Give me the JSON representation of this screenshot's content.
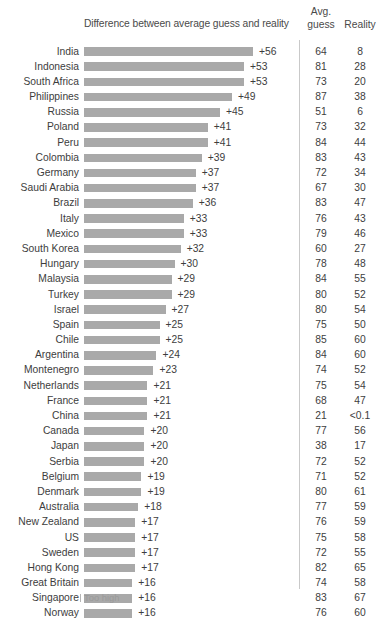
{
  "header": {
    "bar_column_title": "Difference between average guess and reality",
    "avg_line1": "Avg.",
    "avg_line2": "guess",
    "reality": "Reality"
  },
  "legend": {
    "tick_icon": "tick-mark-icon",
    "label": "Too high"
  },
  "chart_data": {
    "type": "bar",
    "title": "Difference between average guess and reality",
    "xlabel": "",
    "ylabel": "",
    "orientation": "horizontal",
    "grid": false,
    "legend_position": "bottom-left",
    "legend_entries": [
      "Too high"
    ],
    "xlim": [
      0,
      60
    ],
    "bar_color": "#a9a9a9",
    "columns": [
      "Country",
      "Difference between average guess and reality",
      "Avg. guess",
      "Reality"
    ],
    "categories": [
      "India",
      "Indonesia",
      "South Africa",
      "Philippines",
      "Russia",
      "Poland",
      "Peru",
      "Colombia",
      "Germany",
      "Saudi Arabia",
      "Brazil",
      "Italy",
      "Mexico",
      "South Korea",
      "Hungary",
      "Malaysia",
      "Turkey",
      "Israel",
      "Spain",
      "Chile",
      "Argentina",
      "Montenegro",
      "Netherlands",
      "France",
      "China",
      "Canada",
      "Japan",
      "Serbia",
      "Belgium",
      "Denmark",
      "Australia",
      "New Zealand",
      "US",
      "Sweden",
      "Hong Kong",
      "Great Britain",
      "Singapore",
      "Norway"
    ],
    "values": [
      56,
      53,
      53,
      49,
      45,
      41,
      41,
      39,
      37,
      37,
      36,
      33,
      33,
      32,
      30,
      29,
      29,
      27,
      25,
      25,
      24,
      23,
      21,
      21,
      21,
      20,
      20,
      20,
      19,
      19,
      18,
      17,
      17,
      17,
      17,
      16,
      16,
      16
    ],
    "value_labels": [
      "+56",
      "+53",
      "+53",
      "+49",
      "+45",
      "+41",
      "+41",
      "+39",
      "+37",
      "+37",
      "+36",
      "+33",
      "+33",
      "+32",
      "+30",
      "+29",
      "+29",
      "+27",
      "+25",
      "+25",
      "+24",
      "+23",
      "+21",
      "+21",
      "+21",
      "+20",
      "+20",
      "+20",
      "+19",
      "+19",
      "+18",
      "+17",
      "+17",
      "+17",
      "+17",
      "+16",
      "+16",
      "+16"
    ],
    "avg_guess": [
      "64",
      "81",
      "73",
      "87",
      "51",
      "73",
      "84",
      "83",
      "72",
      "67",
      "83",
      "76",
      "79",
      "60",
      "78",
      "84",
      "80",
      "80",
      "75",
      "85",
      "84",
      "74",
      "75",
      "68",
      "21",
      "77",
      "38",
      "72",
      "71",
      "80",
      "77",
      "76",
      "75",
      "72",
      "82",
      "74",
      "83",
      "76"
    ],
    "reality": [
      "8",
      "28",
      "20",
      "38",
      "6",
      "32",
      "44",
      "43",
      "34",
      "30",
      "47",
      "43",
      "46",
      "27",
      "48",
      "55",
      "52",
      "54",
      "50",
      "60",
      "60",
      "52",
      "54",
      "47",
      "<0.1",
      "56",
      "17",
      "52",
      "52",
      "61",
      "59",
      "59",
      "58",
      "55",
      "65",
      "58",
      "67",
      "60"
    ]
  }
}
